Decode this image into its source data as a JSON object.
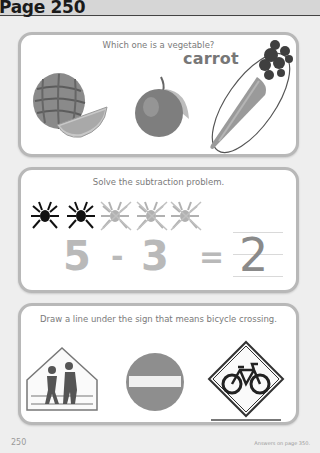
{
  "header": {
    "title": "Page 250"
  },
  "activities": [
    {
      "prompt": "Which one is a vegetable?",
      "items": [
        {
          "name": "watermelon",
          "selected": false
        },
        {
          "name": "plum",
          "selected": false
        },
        {
          "name": "carrot",
          "selected": true,
          "label": "carrot"
        }
      ]
    },
    {
      "prompt": "Solve the subtraction problem.",
      "spiders": {
        "total": 5,
        "crossed_out": 3
      },
      "equation": {
        "minuend": "5",
        "operator": "-",
        "subtrahend": "3",
        "equals": "=",
        "answer": "2"
      }
    },
    {
      "prompt": "Draw a line under the sign that means bicycle crossing.",
      "signs": [
        {
          "name": "school-crossing-sign",
          "underlined": false
        },
        {
          "name": "do-not-enter-sign",
          "underlined": false
        },
        {
          "name": "bicycle-crossing-sign",
          "underlined": true
        }
      ]
    }
  ],
  "footer": {
    "page_number": "250",
    "answers_note": "Answers on page 350."
  },
  "colors": {
    "card_border": "#b8b8b8",
    "background": "#eeeeee",
    "header_bg": "#d6d6d6"
  }
}
